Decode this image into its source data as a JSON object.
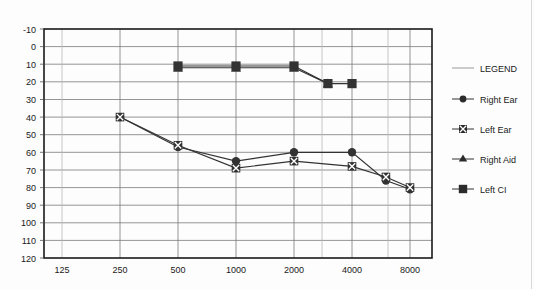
{
  "chart_data": {
    "type": "line",
    "title": "",
    "subtitle": "",
    "xlabel": "",
    "ylabel": "",
    "x_scale": "log",
    "x_tick_labels": [
      "125",
      "250",
      "500",
      "1000",
      "2000",
      "4000",
      "8000"
    ],
    "x_tick_values": [
      125,
      250,
      500,
      1000,
      2000,
      4000,
      8000
    ],
    "y_tick_labels": [
      "-10",
      "0",
      "10",
      "20",
      "30",
      "40",
      "50",
      "60",
      "70",
      "80",
      "90",
      "100",
      "110",
      "120"
    ],
    "y_tick_values": [
      -10,
      0,
      10,
      20,
      30,
      40,
      50,
      60,
      70,
      80,
      90,
      100,
      110,
      120
    ],
    "ylim": [
      -10,
      120
    ],
    "y_inverted": true,
    "xlim": [
      105,
      11000
    ],
    "grid": true,
    "legend_position": "right",
    "series": [
      {
        "name": "Right Ear",
        "marker": "filled-circle",
        "color": "#333333",
        "points": [
          {
            "x": 250,
            "y": 40
          },
          {
            "x": 500,
            "y": 57
          },
          {
            "x": 1000,
            "y": 65
          },
          {
            "x": 2000,
            "y": 60
          },
          {
            "x": 4000,
            "y": 60
          },
          {
            "x": 6000,
            "y": 76
          },
          {
            "x": 8000,
            "y": 81
          }
        ]
      },
      {
        "name": "Left Ear",
        "marker": "x-in-square",
        "color": "#333333",
        "points": [
          {
            "x": 250,
            "y": 40
          },
          {
            "x": 500,
            "y": 56
          },
          {
            "x": 1000,
            "y": 69
          },
          {
            "x": 2000,
            "y": 65
          },
          {
            "x": 4000,
            "y": 68
          },
          {
            "x": 6000,
            "y": 74
          },
          {
            "x": 8000,
            "y": 80
          }
        ]
      },
      {
        "name": "Right Aid",
        "marker": "filled-triangle",
        "color": "#333333",
        "points": [
          {
            "x": 500,
            "y": 12
          },
          {
            "x": 1000,
            "y": 12
          },
          {
            "x": 2000,
            "y": 12
          },
          {
            "x": 3000,
            "y": 21
          }
        ]
      },
      {
        "name": "Left CI",
        "marker": "filled-square",
        "color": "#333333",
        "points": [
          {
            "x": 500,
            "y": 11
          },
          {
            "x": 1000,
            "y": 11
          },
          {
            "x": 2000,
            "y": 11
          },
          {
            "x": 3000,
            "y": 21
          },
          {
            "x": 4000,
            "y": 21
          }
        ]
      }
    ]
  },
  "legend": {
    "title": "LEGEND",
    "entries": [
      {
        "label": "Right Ear",
        "marker": "filled-circle"
      },
      {
        "label": "Left Ear",
        "marker": "x-in-square"
      },
      {
        "label": "Right Aid",
        "marker": "filled-triangle"
      },
      {
        "label": "Left CI",
        "marker": "filled-square"
      }
    ]
  },
  "colors": {
    "axis": "#1a1a1a",
    "grid_major": "#7a7a7a",
    "grid_minor": "#b8b8b8",
    "series": "#333333",
    "page_border": "#d8d8d8",
    "background": "#fdfdfd"
  },
  "axes": {
    "y_labels": [
      "-10",
      "0",
      "10",
      "20",
      "30",
      "40",
      "50",
      "60",
      "70",
      "80",
      "90",
      "100",
      "110",
      "120"
    ],
    "x_labels": [
      "125",
      "250",
      "500",
      "1000",
      "2000",
      "4000",
      "8000"
    ]
  }
}
